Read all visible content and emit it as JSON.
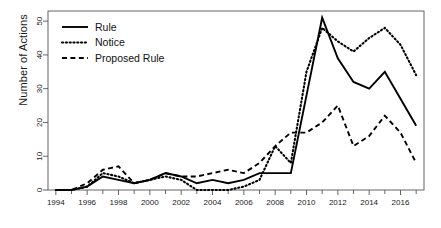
{
  "chart_data": {
    "type": "line",
    "title": "",
    "xlabel": "",
    "ylabel": "Number of Actions",
    "xlim": [
      1993.5,
      2017.5
    ],
    "ylim": [
      0,
      53
    ],
    "grid": false,
    "legend_position": "top-left",
    "x": [
      1994,
      1995,
      1996,
      1997,
      1998,
      1999,
      2000,
      2001,
      2002,
      2003,
      2004,
      2005,
      2006,
      2007,
      2008,
      2009,
      2010,
      2011,
      2012,
      2013,
      2014,
      2015,
      2016,
      2017
    ],
    "xticks": [
      1994,
      1996,
      1998,
      2000,
      2002,
      2004,
      2006,
      2008,
      2010,
      2012,
      2014,
      2016
    ],
    "xtick_labels": [
      "1994",
      "1996",
      "1998",
      "2000",
      "2002",
      "2004",
      "2006",
      "2008",
      "2010",
      "2012",
      "2014",
      "2016"
    ],
    "xminor_ticks": [
      1995,
      1997,
      1999,
      2001,
      2003,
      2005,
      2007,
      2009,
      2011,
      2013,
      2015,
      2017
    ],
    "yticks": [
      0,
      10,
      20,
      30,
      40,
      50
    ],
    "ytick_labels": [
      "0",
      "10",
      "20",
      "30",
      "40",
      "50"
    ],
    "series": [
      {
        "name": "Rule",
        "style": "solid",
        "color": "#000000",
        "values": [
          0,
          0,
          1,
          4,
          3,
          2,
          3,
          5,
          4,
          2,
          3,
          2,
          3,
          5,
          5,
          5,
          28,
          51,
          39,
          32,
          30,
          35,
          27,
          19
        ]
      },
      {
        "name": "Notice",
        "style": "dotted",
        "color": "#000000",
        "values": [
          0,
          0,
          1,
          5,
          4,
          2,
          3,
          4,
          3,
          0,
          0,
          0,
          1,
          3,
          13,
          8,
          35,
          48,
          44,
          41,
          45,
          48,
          43,
          34
        ]
      },
      {
        "name": "Proposed Rule",
        "style": "dashed",
        "color": "#000000",
        "values": [
          0,
          0,
          2,
          6,
          7,
          2,
          3,
          5,
          4,
          4,
          5,
          6,
          5,
          8,
          13,
          17,
          17,
          20,
          25,
          13,
          16,
          22,
          17,
          8
        ]
      }
    ]
  },
  "legend": {
    "entries": [
      {
        "label": "Rule",
        "style": "solid"
      },
      {
        "label": "Notice",
        "style": "dotted"
      },
      {
        "label": "Proposed Rule",
        "style": "dashed"
      }
    ]
  },
  "axes": {
    "y_title": "Number of Actions"
  }
}
